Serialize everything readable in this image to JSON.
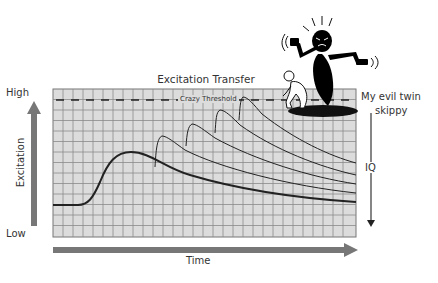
{
  "diagram": {
    "title": "Excitation Transfer",
    "y_axis": {
      "label": "Excitation",
      "high_label": "High",
      "low_label": "Low"
    },
    "x_axis": {
      "label": "Time"
    },
    "threshold": {
      "label": "Crazy Threshold",
      "style": "dashed"
    },
    "annotation": {
      "line1": "My evil twin",
      "line2": "skippy"
    },
    "side_arrow": {
      "label": "IQ",
      "direction": "down"
    },
    "curves": [
      {
        "name": "initial-arousal",
        "style": "thick",
        "peak_x": 131,
        "peak_y": 152
      },
      {
        "name": "transfer-1",
        "style": "thin",
        "peak_x": 162,
        "peak_y": 136
      },
      {
        "name": "transfer-2",
        "style": "thin",
        "peak_x": 192,
        "peak_y": 124
      },
      {
        "name": "transfer-3",
        "style": "thin",
        "peak_x": 220,
        "peak_y": 110
      },
      {
        "name": "transfer-4",
        "style": "thin",
        "peak_x": 243,
        "peak_y": 97
      }
    ],
    "illustration": {
      "figures": [
        "black-genie-figure",
        "crouching-man-figure"
      ]
    },
    "colors": {
      "grid_background": "#dcdcdc",
      "grid_lines": "#8a8a8a",
      "arrow": "#777777",
      "curve": "#222222",
      "genie": "#000000"
    }
  }
}
